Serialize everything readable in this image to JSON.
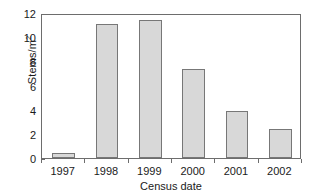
{
  "chart_data": {
    "type": "bar",
    "title": "",
    "xlabel": "Census date",
    "ylabel": "Stems/m2",
    "ylabel_base": "Stems/m",
    "ylabel_exponent": "2",
    "categories": [
      "1997",
      "1998",
      "1999",
      "2000",
      "2001",
      "2002"
    ],
    "values": [
      0.45,
      11.05,
      11.4,
      7.35,
      3.9,
      2.4
    ],
    "ylim": [
      0,
      12
    ],
    "yticks": [
      0,
      2,
      4,
      6,
      8,
      10,
      12
    ],
    "ytick_labels": [
      "0",
      "2",
      "4",
      "6",
      "8",
      "10",
      "12"
    ],
    "grid": false,
    "legend": null,
    "bar_fill_color": "#d8d8d8",
    "bar_edge_color": "#777777",
    "axis_color": "#6d6d6d",
    "background_color": "#ffffff"
  }
}
